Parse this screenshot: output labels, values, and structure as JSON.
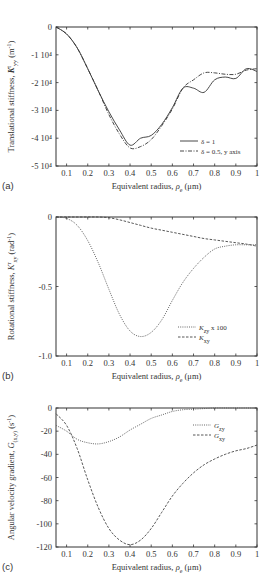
{
  "figure": {
    "panels": [
      {
        "letter": "(a)",
        "ylabel": "Translational stiffness, Kᵗᵧᵧ (m⁻¹)",
        "ylabel_main": "Translational stiffness, ",
        "ylabel_sym": "K",
        "ylabel_sup": "t",
        "ylabel_sub": "yy",
        "ylabel_unit": " (m",
        "ylabel_unit_sup": "-1",
        "ylabel_unit_end": ")",
        "xlabel_main": "Equivalent radius, ",
        "xlabel_sym": "ρ",
        "xlabel_sub": "e",
        "xlabel_unit": " (μm)",
        "yticks": [
          "0",
          "-1 10⁴",
          "-2 10⁴",
          "-3 10⁴",
          "-4 10⁴",
          "-5 10⁴"
        ],
        "xticks": [
          "0.1",
          "0.2",
          "0.3",
          "0.4",
          "0.5",
          "0.6",
          "0.7",
          "0.8",
          "0.9",
          "1"
        ],
        "legend": [
          "δ = 1",
          "δ = 0.5, y axis"
        ]
      },
      {
        "letter": "(b)",
        "ylabel_main": "Rotational stiffness, ",
        "ylabel_sym": "K",
        "ylabel_sup": "r",
        "ylabel_sub": "xy",
        "ylabel_unit": " (rad",
        "ylabel_unit_sup": "-1",
        "ylabel_unit_end": ")",
        "xlabel_main": "Equivalent radius, ",
        "xlabel_sym": "ρ",
        "xlabel_sub": "e",
        "xlabel_unit": " (μm)",
        "yticks": [
          "0",
          "-0.5",
          "-1.0"
        ],
        "xticks": [
          "0.1",
          "0.2",
          "0.3",
          "0.4",
          "0.5",
          "0.6",
          "0.7",
          "0.8",
          "0.9",
          "1"
        ],
        "legend": [
          "Kʳzy x 100",
          "Kʳxy"
        ],
        "legend_sym": [
          "K",
          "K"
        ],
        "legend_sup": [
          "r",
          "r"
        ],
        "legend_sub": [
          "zy",
          "xy"
        ],
        "legend_suffix": [
          " x 100",
          ""
        ]
      },
      {
        "letter": "(c)",
        "ylabel_main": "Angular velocity gradient, ",
        "ylabel_sym": "G",
        "ylabel_sub": "(x,y)",
        "ylabel_unit": " (s",
        "ylabel_unit_sup": "-1",
        "ylabel_unit_end": ")",
        "xlabel_main": "Equivalent radius, ",
        "xlabel_sym": "ρ",
        "xlabel_sub": "e",
        "xlabel_unit": " (μm)",
        "yticks": [
          "0",
          "-20",
          "-40",
          "-60",
          "-80",
          "-100",
          "-120"
        ],
        "xticks": [
          "0.1",
          "0.2",
          "0.3",
          "0.4",
          "0.5",
          "0.6",
          "0.7",
          "0.8",
          "0.9",
          "1"
        ],
        "legend_sym": [
          "G",
          "G"
        ],
        "legend_sub": [
          "zy",
          "xy"
        ]
      }
    ]
  },
  "chart_data": [
    {
      "type": "line",
      "panel": "(a)",
      "title": "",
      "xlabel": "Equivalent radius, ρe (μm)",
      "ylabel": "Translational stiffness, K^t_yy (m^-1)",
      "xlim": [
        0.05,
        1.0
      ],
      "ylim": [
        -50000,
        0
      ],
      "grid": false,
      "legend_position": "lower right",
      "x": [
        0.05,
        0.1,
        0.15,
        0.2,
        0.25,
        0.3,
        0.35,
        0.4,
        0.45,
        0.5,
        0.55,
        0.6,
        0.65,
        0.7,
        0.75,
        0.8,
        0.85,
        0.9,
        0.95,
        1.0
      ],
      "series": [
        {
          "name": "δ = 1",
          "style": "solid",
          "values": [
            0,
            -2500,
            -7500,
            -15000,
            -23000,
            -30500,
            -37000,
            -42500,
            -40000,
            -39000,
            -35000,
            -29000,
            -22000,
            -22000,
            -23500,
            -19000,
            -18000,
            -18500,
            -15000,
            -16000
          ]
        },
        {
          "name": "δ = 0.5, y axis",
          "style": "dash-dot",
          "values": [
            0,
            -2500,
            -7500,
            -15000,
            -23000,
            -31500,
            -38500,
            -43500,
            -43000,
            -40500,
            -35500,
            -29500,
            -22000,
            -19000,
            -16500,
            -16500,
            -17000,
            -17000,
            -15500,
            -15000
          ]
        }
      ]
    },
    {
      "type": "line",
      "panel": "(b)",
      "title": "",
      "xlabel": "Equivalent radius, ρe (μm)",
      "ylabel": "Rotational stiffness, K^r_xy (rad^-1)",
      "xlim": [
        0.05,
        1.0
      ],
      "ylim": [
        -1.0,
        0
      ],
      "yticks": [
        0,
        -0.5,
        -1.0
      ],
      "grid": false,
      "legend_position": "lower right",
      "x": [
        0.05,
        0.1,
        0.15,
        0.2,
        0.25,
        0.3,
        0.35,
        0.4,
        0.45,
        0.5,
        0.55,
        0.6,
        0.65,
        0.7,
        0.75,
        0.8,
        0.85,
        0.9,
        0.95,
        1.0
      ],
      "series": [
        {
          "name": "K^r_zy x 100",
          "style": "dotted",
          "values": [
            0,
            -0.01,
            -0.06,
            -0.17,
            -0.33,
            -0.52,
            -0.7,
            -0.82,
            -0.86,
            -0.83,
            -0.74,
            -0.6,
            -0.47,
            -0.37,
            -0.29,
            -0.23,
            -0.21,
            -0.2,
            -0.2,
            -0.2
          ]
        },
        {
          "name": "K^r_xy",
          "style": "dashed",
          "values": [
            0,
            0,
            0,
            0,
            0,
            -0.005,
            -0.02,
            -0.04,
            -0.06,
            -0.08,
            -0.095,
            -0.11,
            -0.125,
            -0.14,
            -0.155,
            -0.165,
            -0.175,
            -0.185,
            -0.195,
            -0.21
          ]
        }
      ]
    },
    {
      "type": "line",
      "panel": "(c)",
      "title": "",
      "xlabel": "Equivalent radius, ρe (μm)",
      "ylabel": "Angular velocity gradient, G(x,y) (s^-1)",
      "xlim": [
        0.05,
        1.0
      ],
      "ylim": [
        -120,
        0
      ],
      "yticks": [
        0,
        -20,
        -40,
        -60,
        -80,
        -100,
        -120
      ],
      "grid": false,
      "legend_position": "upper right",
      "x": [
        0.05,
        0.1,
        0.15,
        0.2,
        0.25,
        0.3,
        0.35,
        0.4,
        0.45,
        0.5,
        0.55,
        0.6,
        0.65,
        0.7,
        0.75,
        0.8,
        0.85,
        0.9,
        0.95,
        1.0
      ],
      "series": [
        {
          "name": "G_zy",
          "style": "dotted",
          "values": [
            -15,
            -20,
            -27,
            -30,
            -31,
            -29,
            -25,
            -19,
            -14,
            -9,
            -6,
            -3,
            -1.5,
            -1,
            -0.5,
            0,
            0,
            0,
            0,
            0
          ]
        },
        {
          "name": "G_xy",
          "style": "dashed",
          "values": [
            -5,
            -15,
            -35,
            -62,
            -86,
            -104,
            -114,
            -118,
            -114,
            -104,
            -90,
            -76,
            -65,
            -56,
            -49,
            -44,
            -40,
            -37,
            -35,
            -32
          ]
        }
      ]
    }
  ]
}
